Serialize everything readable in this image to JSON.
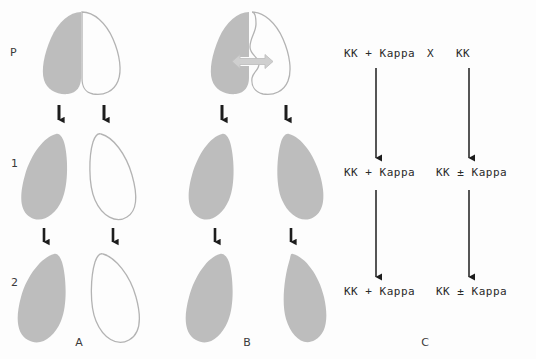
{
  "figure": {
    "background_color": "#fdfdfd",
    "cell_fill_color": "#bdbdbd",
    "cell_outline_color": "#b3b3b3",
    "arrow_color": "#1d1d1d",
    "exchange_arrow_color": "#c9c9c9",
    "text_color": "#2b2b2b",
    "operator_color": "#8f8f8f"
  },
  "row_labels": [
    {
      "id": "P",
      "label": "P"
    },
    {
      "id": "1",
      "label": "1"
    },
    {
      "id": "2",
      "label": "2"
    }
  ],
  "panel_labels": [
    {
      "id": "A",
      "label": "A"
    },
    {
      "id": "B",
      "label": "B"
    },
    {
      "id": "C",
      "label": "C"
    }
  ],
  "panel_a": {
    "generation_p": {
      "left_cell": {
        "state": "filled",
        "name": "kappa-bearing-cell"
      },
      "right_cell": {
        "state": "outline",
        "name": "kappa-free-cell"
      },
      "conjugation": "paired-no-exchange"
    },
    "generation_1": {
      "left_cell": {
        "state": "filled"
      },
      "right_cell": {
        "state": "outline"
      }
    },
    "generation_2": {
      "left_cell": {
        "state": "filled"
      },
      "right_cell": {
        "state": "outline"
      }
    }
  },
  "panel_b": {
    "generation_p": {
      "left_cell": {
        "state": "filled",
        "name": "kappa-bearing-cell"
      },
      "right_cell": {
        "state": "outline",
        "name": "kappa-free-cell"
      },
      "conjugation": "paired-with-cytoplasmic-exchange",
      "exchange_arrow": "double-headed"
    },
    "generation_1": {
      "left_cell": {
        "state": "filled"
      },
      "right_cell": {
        "state": "filled"
      }
    },
    "generation_2": {
      "left_cell": {
        "state": "filled"
      },
      "right_cell": {
        "state": "filled"
      }
    }
  },
  "panel_c": {
    "cross_symbol": "X",
    "rows": [
      {
        "generation": "P",
        "left": {
          "genotype": "KK",
          "operator": "+",
          "cytoplasm": "Kappa"
        },
        "right": {
          "genotype": "KK",
          "operator": "",
          "cytoplasm": ""
        }
      },
      {
        "generation": "1",
        "left": {
          "genotype": "KK",
          "operator": "+",
          "cytoplasm": "Kappa"
        },
        "right": {
          "genotype": "KK",
          "operator": "±",
          "cytoplasm": "Kappa"
        }
      },
      {
        "generation": "2",
        "left": {
          "genotype": "KK",
          "operator": "+",
          "cytoplasm": "Kappa"
        },
        "right": {
          "genotype": "KK",
          "operator": "±",
          "cytoplasm": "Kappa"
        }
      }
    ],
    "left_line_text": {
      "p": "KK + Kappa",
      "g1": "KK + Kappa",
      "g2": "KK + Kappa"
    },
    "right_line_text": {
      "p": "KK",
      "g1": "KK ± Kappa",
      "g2": "KK ± Kappa"
    }
  }
}
